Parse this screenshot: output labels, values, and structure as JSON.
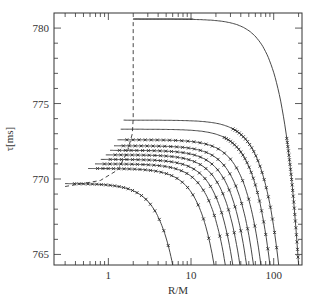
{
  "chart_data": {
    "type": "line",
    "title": "",
    "xlabel": "R/M",
    "ylabel": "τ[ms]",
    "xscale": "log",
    "xlim": [
      0.22,
      220
    ],
    "ylim": [
      764.3,
      781
    ],
    "grid": false,
    "legend": null,
    "x_ticks": [
      {
        "value": 1,
        "label": "1"
      },
      {
        "value": 10,
        "label": "10"
      },
      {
        "value": 100,
        "label": "100"
      }
    ],
    "y_ticks": [
      {
        "value": 765,
        "label": "765"
      },
      {
        "value": 770,
        "label": "770"
      },
      {
        "value": 775,
        "label": "775"
      },
      {
        "value": 780,
        "label": "780"
      }
    ],
    "dashed_line": {
      "description": "boundary curve (dashed)",
      "points": [
        [
          0.3,
          769.5
        ],
        [
          0.8,
          769.9
        ],
        [
          1.3,
          770.6
        ],
        [
          1.7,
          771.8
        ],
        [
          1.95,
          773.0
        ],
        [
          2.0,
          774.0
        ],
        [
          2.0,
          780.6
        ]
      ]
    },
    "series": [
      {
        "name": "curve-1",
        "start_tau": 769.7,
        "end_R": 6.0,
        "shape_R0": 2.0,
        "markers": true
      },
      {
        "name": "curve-2",
        "start_tau": 770.7,
        "end_R": 19.0,
        "shape_R0": 6.0,
        "markers": true
      },
      {
        "name": "curve-3",
        "start_tau": 771.0,
        "end_R": 26.0,
        "shape_R0": 8.5,
        "markers": true
      },
      {
        "name": "curve-4",
        "start_tau": 771.3,
        "end_R": 32.0,
        "shape_R0": 10.5,
        "markers": true
      },
      {
        "name": "curve-5",
        "start_tau": 771.6,
        "end_R": 39.0,
        "shape_R0": 13.0,
        "markers": true
      },
      {
        "name": "curve-6",
        "start_tau": 771.9,
        "end_R": 47.0,
        "shape_R0": 15.5,
        "markers": true
      },
      {
        "name": "curve-7",
        "start_tau": 772.2,
        "end_R": 57.0,
        "shape_R0": 19.0,
        "markers": true
      },
      {
        "name": "curve-8",
        "start_tau": 772.6,
        "end_R": 70.0,
        "shape_R0": 23.0,
        "markers": true
      },
      {
        "name": "curve-9",
        "start_tau": 773.3,
        "end_R": 90.0,
        "shape_R0": 30.0,
        "markers": true
      },
      {
        "name": "curve-10",
        "start_tau": 773.9,
        "end_R": 115.0,
        "shape_R0": 38.0,
        "markers": true
      },
      {
        "name": "curve-11",
        "start_tau": 780.6,
        "end_R": 200.0,
        "shape_R0": 60.0,
        "markers": true
      }
    ]
  }
}
